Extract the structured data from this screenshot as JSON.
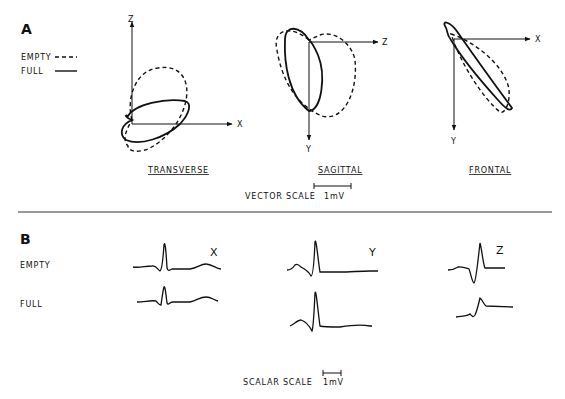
{
  "panel_a": {
    "label": "A",
    "legend": [
      {
        "name": "EMPTY",
        "style": "dashed"
      },
      {
        "name": "FULL",
        "style": "solid"
      }
    ],
    "planes": [
      {
        "title": "TRANSVERSE",
        "axes": [
          "Z",
          "X"
        ]
      },
      {
        "title": "SAGITTAL",
        "axes": [
          "Z",
          "Y"
        ]
      },
      {
        "title": "FRONTAL",
        "axes": [
          "X",
          "Y"
        ]
      }
    ],
    "scale": {
      "label": "VECTOR SCALE",
      "unit": "1mV"
    }
  },
  "panel_b": {
    "label": "B",
    "rows": [
      "EMPTY",
      "FULL"
    ],
    "leads": [
      "X",
      "Y",
      "Z"
    ],
    "scale": {
      "label": "SCALAR SCALE",
      "unit": "1mV"
    }
  },
  "colors": {
    "ink": "#111111",
    "background": "#ffffff"
  }
}
